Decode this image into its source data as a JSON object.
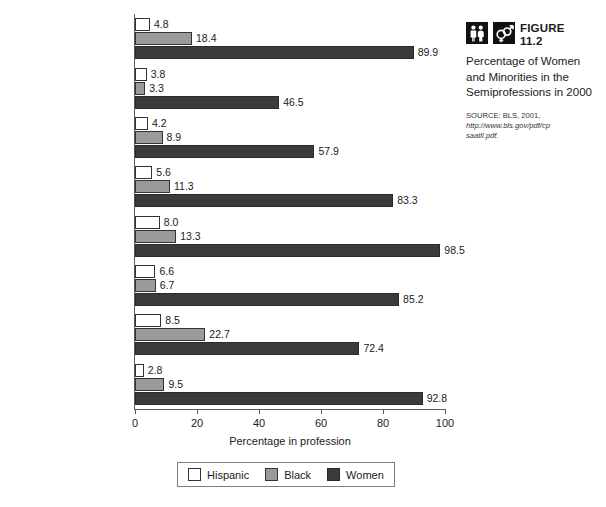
{
  "chart_data": {
    "type": "bar",
    "orientation": "horizontal",
    "title": "Percentage of Women and Minorities in the Semiprofessions in 2000",
    "xlabel": "Percentage in profession",
    "ylabel": "",
    "xlim": [
      0,
      100
    ],
    "xticks": [
      0,
      20,
      40,
      60,
      80,
      100
    ],
    "grid": false,
    "legend_position": "bottom",
    "categories": [
      "Dietitians",
      "Pharmacists",
      "Secondary teachers",
      "Elementary teachers",
      "Nursery school and kindergarten teachers",
      "Librarians",
      "Social workers",
      "Registered nurses"
    ],
    "series": [
      {
        "name": "Hispanic",
        "color": "#ffffff",
        "values": [
          4.8,
          3.8,
          4.2,
          5.6,
          8.0,
          6.6,
          8.5,
          2.8
        ],
        "labels": [
          "4.8",
          "3.8",
          "4.2",
          "5.6",
          "8.0",
          "6.6",
          "8.5",
          "2.8"
        ]
      },
      {
        "name": "Black",
        "color": "#9a9a9a",
        "values": [
          18.4,
          3.3,
          8.9,
          11.3,
          13.3,
          6.7,
          22.7,
          9.5
        ],
        "labels": [
          "18.4",
          "3.3",
          "8.9",
          "11.3",
          "13.3",
          "6.7",
          "22.7",
          "9.5"
        ]
      },
      {
        "name": "Women",
        "color": "#3b3b3b",
        "values": [
          89.9,
          46.5,
          57.9,
          83.3,
          98.5,
          85.2,
          72.4,
          92.8
        ],
        "labels": [
          "89.9",
          "46.5",
          "57.9",
          "83.3",
          "98.5",
          "85.2",
          "72.4",
          "92.8"
        ]
      }
    ]
  },
  "caption": {
    "figure_word": "FIGURE",
    "figure_number": "11.2",
    "title": "Percentage of Women and Minorities in the Semiprofessions in 2000",
    "source_line1": "SOURCE: BLS, 2001,",
    "source_line2": "http://www.bls.gov/pdf/cp",
    "source_line3": "saatll.pdf.",
    "icon1": "two-people-icon",
    "icon2": "gender-symbols-icon"
  },
  "category_label_lines": [
    [
      "Dietitians"
    ],
    [
      "Pharmacists"
    ],
    [
      "Secondary teachers"
    ],
    [
      "Elementary teachers"
    ],
    [
      "Nursery school and",
      "kindergarten teachers"
    ],
    [
      "Librarians"
    ],
    [
      "Social workers"
    ],
    [
      "Registered nurses"
    ]
  ]
}
